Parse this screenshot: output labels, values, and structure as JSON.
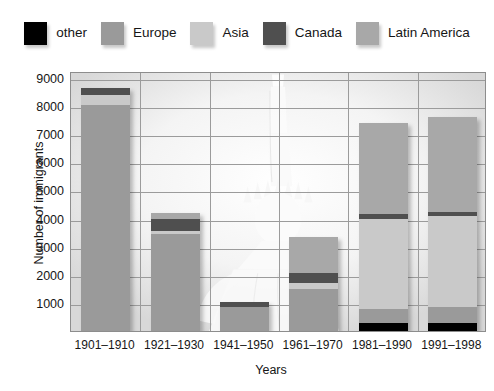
{
  "legend": {
    "items": [
      {
        "label": "other",
        "color": "#000000",
        "key": "other"
      },
      {
        "label": "Europe",
        "color": "#9a9a9a",
        "key": "europe"
      },
      {
        "label": "Asia",
        "color": "#c9c9c9",
        "key": "asia"
      },
      {
        "label": "Canada",
        "color": "#4f4f4f",
        "key": "canada"
      },
      {
        "label": "Latin America",
        "color": "#a8a8a8",
        "key": "latin_america"
      }
    ]
  },
  "axes": {
    "ylabel": "Number of immigrants",
    "xlabel": "Years",
    "yticks": [
      1000,
      2000,
      3000,
      4000,
      5000,
      6000,
      7000,
      8000,
      9000
    ],
    "ymin": 0,
    "ymax": 9250
  },
  "chart_data": {
    "type": "bar",
    "title": "",
    "xlabel": "Years",
    "ylabel": "Number of immigrants",
    "ylim": [
      0,
      9250
    ],
    "grid": true,
    "stacked": true,
    "legend_position": "top",
    "categories": [
      "1901–1910",
      "1921–1930",
      "1941–1950",
      "1961–1970",
      "1981–1990",
      "1991–1998"
    ],
    "series": [
      {
        "name": "other",
        "color": "#000000",
        "values": [
          0,
          0,
          0,
          0,
          300,
          300
        ]
      },
      {
        "name": "Europe",
        "color": "#9a9a9a",
        "values": [
          8050,
          3450,
          850,
          1500,
          500,
          550
        ]
      },
      {
        "name": "Asia",
        "color": "#c9c9c9",
        "values": [
          350,
          100,
          0,
          200,
          3200,
          3250
        ]
      },
      {
        "name": "Canada",
        "color": "#4f4f4f",
        "values": [
          250,
          450,
          200,
          350,
          150,
          150
        ]
      },
      {
        "name": "Latin America",
        "color": "#a8a8a8",
        "values": [
          0,
          200,
          0,
          1300,
          3250,
          3350
        ]
      }
    ],
    "totals": [
      8650,
      4200,
      1050,
      3350,
      7400,
      7600
    ]
  }
}
